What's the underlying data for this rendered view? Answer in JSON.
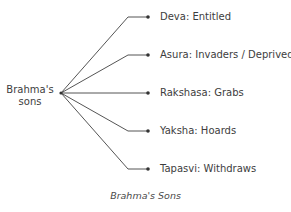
{
  "diagram": {
    "type": "tree",
    "root": {
      "label_line1": "Brahma's",
      "label_line2": "sons"
    },
    "branches": [
      {
        "label": "Deva: Entitled"
      },
      {
        "label": "Asura: Invaders / Deprived"
      },
      {
        "label": "Rakshasa: Grabs"
      },
      {
        "label": "Yaksha: Hoards"
      },
      {
        "label": "Tapasvi: Withdraws"
      }
    ],
    "caption": "Brahma's Sons",
    "colors": {
      "line": "#555555",
      "text": "#3d3d3d"
    }
  }
}
